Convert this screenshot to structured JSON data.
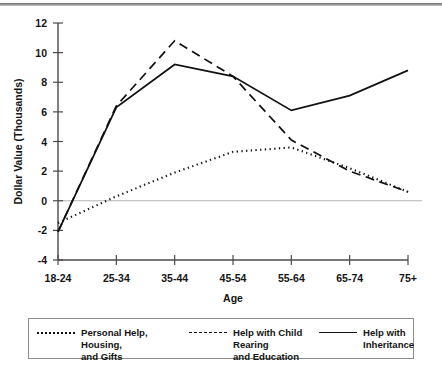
{
  "chart_data": {
    "type": "line",
    "title": "",
    "xlabel": "Age",
    "ylabel": "Dollar Value (Thousands)",
    "categories": [
      "18-24",
      "25-34",
      "35-44",
      "45-54",
      "55-64",
      "65-74",
      "75+"
    ],
    "ylim": [
      -4,
      12
    ],
    "yticks": [
      -4,
      -2,
      0,
      2,
      4,
      6,
      8,
      10,
      12
    ],
    "ytick_labels": [
      "-4",
      "-2",
      "0",
      "2",
      "4",
      "6",
      "8",
      "10",
      "12"
    ],
    "grid": false,
    "zero_reference_line": true,
    "legend_position": "bottom",
    "series": [
      {
        "name": "Personal Help, Housing, and Gifts",
        "style": "dotted",
        "color": "#111111",
        "values": [
          -1.5,
          0.3,
          1.9,
          3.3,
          3.6,
          2.2,
          0.6
        ]
      },
      {
        "name": "Help with Child Rearing and Education",
        "style": "dashed",
        "color": "#111111",
        "values": [
          -2.1,
          6.4,
          10.8,
          8.4,
          4.1,
          2.0,
          0.6
        ]
      },
      {
        "name": "Help with Inheritance",
        "style": "solid",
        "color": "#111111",
        "values": [
          -2.1,
          6.3,
          9.2,
          8.4,
          6.1,
          7.1,
          8.8
        ]
      }
    ]
  },
  "legend": {
    "entries": [
      {
        "label": "Personal Help, Housing,\nand Gifts",
        "style": "dotted"
      },
      {
        "label": "Help with Child Rearing\nand Education",
        "style": "dashed"
      },
      {
        "label": "Help with Inheritance",
        "style": "solid"
      }
    ]
  }
}
